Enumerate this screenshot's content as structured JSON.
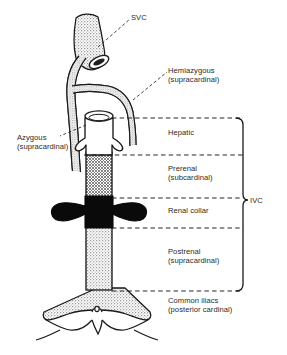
{
  "figure": {
    "type": "anatomical-diagram",
    "width": 287,
    "height": 355,
    "background_color": "#ffffff",
    "ink_color": "#1a1a1a"
  },
  "labels": {
    "svc": {
      "line1": "SVC"
    },
    "hemiazygous": {
      "line1": "Hemiazygous",
      "line2": "(supracardinal)"
    },
    "azygous": {
      "line1": "Azygous",
      "line2": "(supracardinal)"
    },
    "hepatic": {
      "line1": "Hepatic"
    },
    "prerenal": {
      "line1": "Prerenal",
      "line2": "(subcardinal)"
    },
    "renal_collar": {
      "line1": "Renal collar"
    },
    "postrenal": {
      "line1": "Postrenal",
      "line2": "(supracardinal)"
    },
    "common_iliacs": {
      "line1": "Common iliacs",
      "line2": "(posterior cardinal)"
    },
    "ivc": {
      "line1": "IVC"
    }
  },
  "segments": [
    {
      "name": "hepatic",
      "label": "Hepatic",
      "fill": "white",
      "origin": "",
      "y_top": 118,
      "y_bottom": 155
    },
    {
      "name": "prerenal",
      "label": "Prerenal",
      "fill": "cross-hatch",
      "origin": "subcardinal",
      "y_top": 155,
      "y_bottom": 198
    },
    {
      "name": "renal-collar",
      "label": "Renal collar",
      "fill": "solid-black",
      "origin": "",
      "y_top": 198,
      "y_bottom": 228
    },
    {
      "name": "postrenal",
      "label": "Postrenal",
      "fill": "stipple",
      "origin": "supracardinal",
      "y_top": 228,
      "y_bottom": 291
    },
    {
      "name": "common-iliacs",
      "label": "Common iliacs",
      "fill": "stipple",
      "origin": "posterior cardinal",
      "y_top": 291,
      "y_bottom": 348
    }
  ],
  "bracket": {
    "label": "IVC",
    "y_top": 118,
    "y_bottom": 291,
    "x": 243,
    "tick_y": 200
  },
  "divider_lines_y": [
    118,
    155,
    198,
    228,
    291
  ],
  "vessels": [
    {
      "name": "svc",
      "label": "SVC",
      "fill": "stipple"
    },
    {
      "name": "azygous",
      "label": "Azygous",
      "fill": "stipple"
    },
    {
      "name": "hemiazygous",
      "label": "Hemiazygous",
      "fill": "stipple"
    }
  ],
  "colors": {
    "ink": "#1a1a1a",
    "text": "#2a2a2a",
    "paper": "#ffffff",
    "stipple": "#b9b9b9",
    "hatch": "#8e8e8e",
    "solid": "#000000"
  }
}
